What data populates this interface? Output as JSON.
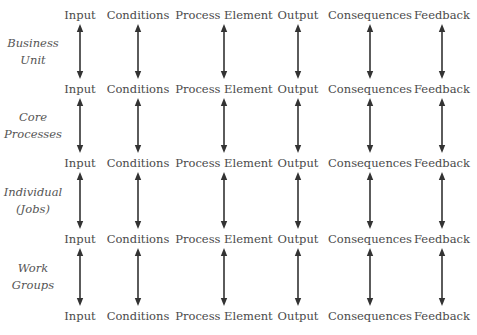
{
  "columns": [
    "Input",
    "Conditions",
    "Process Element",
    "Output",
    "Consequences",
    "Feedback"
  ],
  "column_x": [
    80,
    138,
    224,
    298,
    370,
    442
  ],
  "label_rows_y": [
    8,
    82,
    156,
    232,
    309
  ],
  "levels": [
    {
      "line1": "Business",
      "line2": "Unit"
    },
    {
      "line1": "Core",
      "line2": "Processes"
    },
    {
      "line1": "Individual",
      "line2": "(Jobs)"
    },
    {
      "line1": "Work",
      "line2": "Groups"
    }
  ],
  "arrow_color": "#333333",
  "arrow_style": "double-headed-vertical"
}
